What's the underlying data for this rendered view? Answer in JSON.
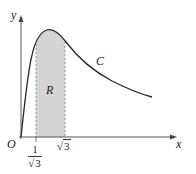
{
  "figure": {
    "axes": {
      "x_label": "x",
      "y_label": "y",
      "origin_label": "O"
    },
    "curve_label": "C",
    "region_label": "R",
    "x_ticks": {
      "left": {
        "numerator": "1",
        "denominator_radicand": "3",
        "radical_sign": "√"
      },
      "right": {
        "radical_sign": "√",
        "radicand": "3"
      }
    },
    "colors": {
      "curve": "#2a2a2a",
      "axis": "#555555",
      "shade": "#d4d4d4",
      "dashed": "#888888"
    }
  }
}
